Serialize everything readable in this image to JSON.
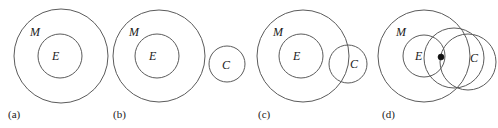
{
  "figure": {
    "title": "",
    "background_color": "#ffffff",
    "stroke_color": "#5b5b5b",
    "text_color": "#1a1a1a",
    "panels": [
      {
        "id": "a",
        "caption": "(a)",
        "caption_x": 8,
        "caption_y": 118,
        "circles": [
          {
            "name": "circle-M",
            "cx": 61,
            "cy": 56,
            "r": 47
          },
          {
            "name": "circle-E",
            "cx": 60,
            "cy": 56,
            "r": 22
          }
        ],
        "labels": [
          {
            "name": "label-M",
            "text": "M",
            "x": 30,
            "y": 36
          },
          {
            "name": "label-E",
            "text": "E",
            "x": 52,
            "y": 60
          }
        ],
        "points": []
      },
      {
        "id": "b",
        "caption": "(b)",
        "caption_x": 113,
        "caption_y": 118,
        "circles": [
          {
            "name": "circle-M",
            "cx": 159,
            "cy": 56,
            "r": 46
          },
          {
            "name": "circle-E",
            "cx": 157,
            "cy": 56,
            "r": 22
          },
          {
            "name": "circle-C",
            "cx": 227,
            "cy": 64,
            "r": 18
          }
        ],
        "labels": [
          {
            "name": "label-M",
            "text": "M",
            "x": 129,
            "y": 36
          },
          {
            "name": "label-E",
            "text": "E",
            "x": 149,
            "y": 60
          },
          {
            "name": "label-C",
            "text": "C",
            "x": 222,
            "y": 69
          }
        ],
        "points": []
      },
      {
        "id": "c",
        "caption": "(c)",
        "caption_x": 258,
        "caption_y": 118,
        "circles": [
          {
            "name": "circle-M",
            "cx": 303,
            "cy": 56,
            "r": 46
          },
          {
            "name": "circle-E",
            "cx": 301,
            "cy": 56,
            "r": 22
          },
          {
            "name": "circle-C",
            "cx": 348,
            "cy": 64,
            "r": 19
          }
        ],
        "labels": [
          {
            "name": "label-M",
            "text": "M",
            "x": 273,
            "y": 36
          },
          {
            "name": "label-E",
            "text": "E",
            "x": 293,
            "y": 60
          },
          {
            "name": "label-C",
            "text": "C",
            "x": 350,
            "y": 68
          }
        ],
        "points": []
      },
      {
        "id": "d",
        "caption": "(d)",
        "caption_x": 382,
        "caption_y": 118,
        "circles": [
          {
            "name": "circle-M",
            "cx": 424,
            "cy": 56,
            "r": 46
          },
          {
            "name": "circle-E",
            "cx": 424,
            "cy": 56,
            "r": 21
          },
          {
            "name": "circle-overlap",
            "cx": 454,
            "cy": 58,
            "r": 30
          },
          {
            "name": "circle-C",
            "cx": 468,
            "cy": 62,
            "r": 28
          }
        ],
        "labels": [
          {
            "name": "label-M",
            "text": "M",
            "x": 396,
            "y": 36
          },
          {
            "name": "label-E",
            "text": "E",
            "x": 415,
            "y": 60
          },
          {
            "name": "label-C",
            "text": "C",
            "x": 470,
            "y": 62
          }
        ],
        "points": [
          {
            "name": "element-point",
            "cx": 441,
            "cy": 57,
            "r": 3
          }
        ]
      }
    ]
  }
}
